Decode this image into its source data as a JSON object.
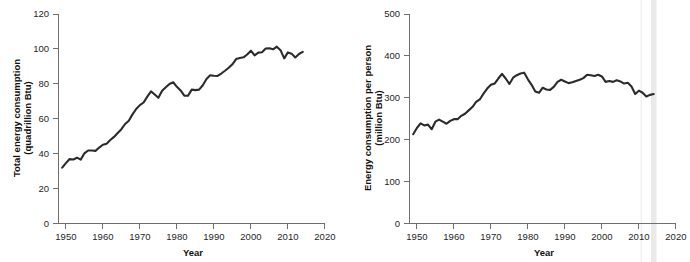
{
  "figure": {
    "background": "#ffffff",
    "line_color": "#2b2b2b",
    "axis_color": "#6f6f6f",
    "clipped_header": "energy per"
  },
  "chart_data": [
    {
      "id": "total-energy-consumption",
      "type": "line",
      "title": "",
      "xlabel": "Year",
      "ylabel": "Total energy consumption\n(quadrillion Btu)",
      "ylabel_line1": "Total energy consumption",
      "ylabel_line2": "(quadrillion Btu)",
      "xlim": [
        1948,
        2020
      ],
      "ylim": [
        0,
        120
      ],
      "xticks": [
        1950,
        1960,
        1970,
        1980,
        1990,
        2000,
        2010,
        2020
      ],
      "yticks": [
        0,
        20,
        40,
        60,
        80,
        100,
        120
      ],
      "grid": false,
      "legend": "none",
      "units": "quadrillion Btu",
      "x": [
        1949,
        1950,
        1951,
        1952,
        1953,
        1954,
        1955,
        1956,
        1957,
        1958,
        1959,
        1960,
        1961,
        1962,
        1963,
        1964,
        1965,
        1966,
        1967,
        1968,
        1969,
        1970,
        1971,
        1972,
        1973,
        1974,
        1975,
        1976,
        1977,
        1978,
        1979,
        1980,
        1981,
        1982,
        1983,
        1984,
        1985,
        1986,
        1987,
        1988,
        1989,
        1990,
        1991,
        1992,
        1993,
        1994,
        1995,
        1996,
        1997,
        1998,
        1999,
        2000,
        2001,
        2002,
        2003,
        2004,
        2005,
        2006,
        2007,
        2008,
        2009,
        2010,
        2011,
        2012,
        2013,
        2014
      ],
      "values": [
        32.0,
        34.6,
        36.9,
        36.7,
        37.7,
        36.6,
        40.2,
        41.8,
        41.8,
        41.6,
        43.5,
        45.1,
        45.7,
        47.8,
        49.6,
        51.8,
        54.0,
        57.0,
        58.9,
        62.5,
        65.6,
        67.8,
        69.3,
        72.7,
        75.7,
        73.9,
        72.0,
        76.0,
        78.0,
        79.9,
        80.9,
        78.3,
        76.2,
        73.2,
        73.2,
        76.7,
        76.4,
        76.7,
        79.2,
        82.8,
        84.9,
        84.6,
        84.5,
        85.9,
        87.5,
        89.2,
        91.2,
        94.2,
        94.8,
        95.2,
        96.8,
        99.0,
        96.3,
        97.9,
        98.1,
        100.2,
        100.4,
        99.8,
        101.3,
        99.3,
        94.6,
        98.0,
        97.3,
        95.1,
        97.1,
        98.3
      ]
    },
    {
      "id": "energy-consumption-per-person",
      "type": "line",
      "title": "",
      "xlabel": "Year",
      "ylabel": "Energy consumption per person\n(million Btu)",
      "ylabel_line1": "Energy consumption per person",
      "ylabel_line2": "(million Btu)",
      "xlim": [
        1948,
        2020
      ],
      "ylim": [
        0,
        500
      ],
      "xticks": [
        1950,
        1960,
        1970,
        1980,
        1990,
        2000,
        2010,
        2020
      ],
      "yticks": [
        0,
        100,
        200,
        300,
        400,
        500
      ],
      "grid": false,
      "legend": "none",
      "units": "million Btu",
      "x": [
        1949,
        1950,
        1951,
        1952,
        1953,
        1954,
        1955,
        1956,
        1957,
        1958,
        1959,
        1960,
        1961,
        1962,
        1963,
        1964,
        1965,
        1966,
        1967,
        1968,
        1969,
        1970,
        1971,
        1972,
        1973,
        1974,
        1975,
        1976,
        1977,
        1978,
        1979,
        1980,
        1981,
        1982,
        1983,
        1984,
        1985,
        1986,
        1987,
        1988,
        1989,
        1990,
        1991,
        1992,
        1993,
        1994,
        1995,
        1996,
        1997,
        1998,
        1999,
        2000,
        2001,
        2002,
        2003,
        2004,
        2005,
        2006,
        2007,
        2008,
        2009,
        2010,
        2011,
        2012,
        2013,
        2014
      ],
      "values": [
        213,
        228,
        239,
        234,
        236,
        225,
        243,
        248,
        243,
        238,
        245,
        249,
        249,
        257,
        262,
        270,
        278,
        290,
        296,
        310,
        322,
        331,
        334,
        346,
        357,
        346,
        333,
        348,
        354,
        358,
        360,
        344,
        331,
        315,
        312,
        324,
        320,
        319,
        326,
        338,
        343,
        339,
        335,
        337,
        340,
        343,
        347,
        355,
        354,
        352,
        355,
        351,
        338,
        340,
        338,
        342,
        339,
        334,
        336,
        327,
        309,
        317,
        312,
        303,
        307,
        309
      ]
    }
  ]
}
